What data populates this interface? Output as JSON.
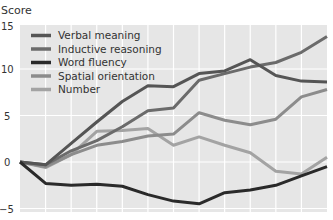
{
  "chart_data": {
    "type": "line",
    "title": "",
    "ylabel": "Score",
    "xlabel": "",
    "ylim": [
      -5,
      15
    ],
    "yticks": [
      -5,
      0,
      5,
      10,
      15
    ],
    "x": [
      0,
      1,
      2,
      3,
      4,
      5,
      6,
      7,
      8,
      9,
      10,
      11,
      12
    ],
    "grid": true,
    "legend_position": "upper-left",
    "series": [
      {
        "name": "Verbal meaning",
        "color": "#555555",
        "values": [
          0,
          -0.3,
          2,
          4.3,
          6.5,
          8.2,
          8.1,
          9.5,
          9.8,
          11,
          9.3,
          8.7,
          8.6
        ]
      },
      {
        "name": "Inductive reasoning",
        "color": "#6b6b6b",
        "values": [
          0,
          -0.3,
          1.2,
          2.3,
          3.8,
          5.5,
          5.8,
          8.8,
          9.5,
          10.2,
          10.7,
          11.8,
          13.5
        ]
      },
      {
        "name": "Word fluency",
        "color": "#2a2a2a",
        "values": [
          0,
          -2.3,
          -2.5,
          -2.4,
          -2.6,
          -3.5,
          -4.2,
          -4.5,
          -3.3,
          -3,
          -2.5,
          -1.5,
          -0.5
        ]
      },
      {
        "name": "Spatial orientation",
        "color": "#8c8c8c",
        "values": [
          0,
          -0.5,
          0.8,
          1.8,
          2.2,
          2.8,
          3,
          5.3,
          4.5,
          4,
          4.6,
          7,
          7.8
        ]
      },
      {
        "name": "Number",
        "color": "#a3a3a3",
        "values": [
          0,
          -0.6,
          0.8,
          3.3,
          3.4,
          3.6,
          1.8,
          2.7,
          1.8,
          1,
          -1,
          -1.3,
          0.5
        ]
      }
    ]
  },
  "axis": {
    "y_title": "Score",
    "y_tick_labels": [
      "15",
      "10",
      "5",
      "0",
      "−5"
    ]
  },
  "legend": {
    "items": [
      "Verbal meaning",
      "Inductive reasoning",
      "Word fluency",
      "Spatial orientation",
      "Number"
    ]
  }
}
